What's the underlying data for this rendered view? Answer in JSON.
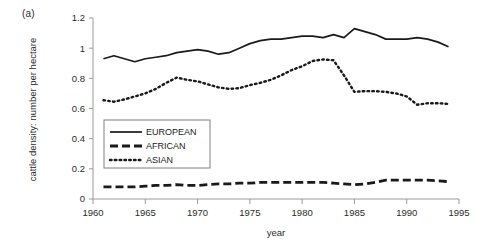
{
  "panel": {
    "label": "(a)"
  },
  "chart_data": {
    "type": "line",
    "title": "",
    "subtitle": "",
    "xlabel": "year",
    "ylabel": "cattle density: number per hectare",
    "xlim": [
      1960,
      1995
    ],
    "ylim": [
      0,
      1.2
    ],
    "xticks": [
      "1960",
      "1965",
      "1970",
      "1975",
      "1980",
      "1985",
      "1990",
      "1995"
    ],
    "xtick_values": [
      1960,
      1965,
      1970,
      1975,
      1980,
      1985,
      1990,
      1995
    ],
    "yticks": [
      "0",
      "0.2",
      "0.4",
      "0.6",
      "0.8",
      "1",
      "1.2"
    ],
    "ytick_values": [
      0,
      0.2,
      0.4,
      0.6,
      0.8,
      1.0,
      1.2
    ],
    "grid": false,
    "legend_position": "center-left",
    "x": [
      1961,
      1962,
      1963,
      1964,
      1965,
      1966,
      1967,
      1968,
      1969,
      1970,
      1971,
      1972,
      1973,
      1974,
      1975,
      1976,
      1977,
      1978,
      1979,
      1980,
      1981,
      1982,
      1983,
      1984,
      1985,
      1986,
      1987,
      1988,
      1989,
      1990,
      1991,
      1992,
      1993,
      1994
    ],
    "series": [
      {
        "name": "EUROPEAN",
        "style": "solid",
        "color": "#1a1a1a",
        "values": [
          0.93,
          0.95,
          0.93,
          0.91,
          0.93,
          0.94,
          0.95,
          0.97,
          0.98,
          0.99,
          0.98,
          0.96,
          0.97,
          1.0,
          1.03,
          1.05,
          1.06,
          1.06,
          1.07,
          1.08,
          1.08,
          1.07,
          1.09,
          1.07,
          1.13,
          1.11,
          1.09,
          1.06,
          1.06,
          1.06,
          1.07,
          1.06,
          1.04,
          1.01
        ]
      },
      {
        "name": "AFRICAN",
        "style": "dashed",
        "color": "#1a1a1a",
        "values": [
          0.08,
          0.08,
          0.08,
          0.08,
          0.085,
          0.09,
          0.09,
          0.095,
          0.09,
          0.09,
          0.095,
          0.1,
          0.1,
          0.105,
          0.105,
          0.11,
          0.11,
          0.11,
          0.11,
          0.11,
          0.11,
          0.11,
          0.105,
          0.1,
          0.095,
          0.1,
          0.11,
          0.125,
          0.125,
          0.125,
          0.125,
          0.125,
          0.12,
          0.115
        ]
      },
      {
        "name": "ASIAN",
        "style": "dotted",
        "color": "#1a1a1a",
        "values": [
          0.655,
          0.645,
          0.66,
          0.68,
          0.7,
          0.73,
          0.77,
          0.805,
          0.79,
          0.78,
          0.76,
          0.74,
          0.73,
          0.735,
          0.755,
          0.77,
          0.79,
          0.82,
          0.855,
          0.88,
          0.915,
          0.925,
          0.92,
          0.82,
          0.71,
          0.715,
          0.715,
          0.71,
          0.7,
          0.68,
          0.625,
          0.635,
          0.635,
          0.63
        ]
      }
    ]
  },
  "legend": {
    "items": [
      {
        "label": "EUROPEAN",
        "style": "solid"
      },
      {
        "label": "AFRICAN",
        "style": "dashed"
      },
      {
        "label": "ASIAN",
        "style": "dotted"
      }
    ]
  }
}
